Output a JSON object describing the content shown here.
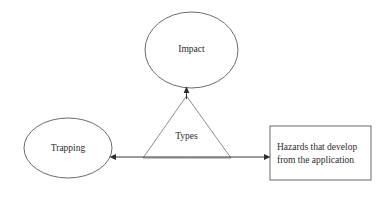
{
  "diagram": {
    "type": "concept-diagram",
    "background_color": "#ffffff",
    "stroke_color": "#5a5a5a",
    "text_color": "#2b2b2b",
    "nodes": {
      "impact": {
        "label": "Impact",
        "shape": "ellipse",
        "cx": 191.5,
        "cy": 50,
        "rx": 46.5,
        "ry": 38
      },
      "trapping": {
        "label": "Trapping",
        "shape": "ellipse",
        "cx": 68,
        "cy": 148,
        "rx": 44,
        "ry": 30
      },
      "hazards": {
        "shape": "rectangle",
        "line1": "Hazards that develop",
        "line2": "from the application",
        "x": 270,
        "y": 126,
        "width": 101,
        "height": 54
      },
      "types": {
        "label": "Types",
        "shape": "triangle",
        "apex_x": 186.5,
        "apex_y": 96,
        "base_left_x": 143,
        "base_right_x": 231,
        "base_y": 158,
        "label_x": 186.5,
        "label_y": 137
      }
    },
    "connectors": [
      {
        "name": "types-to-impact",
        "from": "types",
        "to": "impact",
        "direction": "up",
        "x": 186.5,
        "y_start": 96,
        "y_end": 88
      },
      {
        "name": "types-to-trapping",
        "from": "types",
        "to": "trapping",
        "direction": "left",
        "y": 157,
        "x_start": 186.5,
        "x_end": 110
      },
      {
        "name": "types-to-hazards",
        "from": "types",
        "to": "hazards",
        "direction": "right",
        "y": 157,
        "x_start": 186.5,
        "x_end": 270
      }
    ]
  }
}
